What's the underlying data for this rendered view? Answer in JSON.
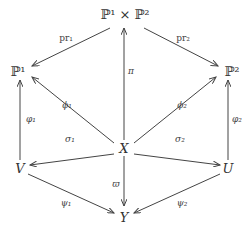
{
  "nodes": {
    "top": "ℙ¹ × ℙ²",
    "p1": "ℙ¹",
    "p2": "ℙ²",
    "x": "X",
    "v": "V",
    "u": "U",
    "y": "Y"
  },
  "arrows": {
    "pr1": "pr₁",
    "pr2": "pr₂",
    "pi": "π",
    "phi1": "ϕ₁",
    "phi2": "ϕ₂",
    "varphi1": "φ₁",
    "varphi2": "φ₂",
    "sigma1": "σ₁",
    "sigma2": "σ₂",
    "varpi": "ϖ",
    "psi1": "ψ₁",
    "psi2": "ψ₂"
  },
  "colors": {
    "line": "#444444",
    "text": "#333333"
  }
}
